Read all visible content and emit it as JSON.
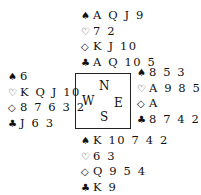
{
  "hands": {
    "north": {
      "spades": "A Q J 9",
      "hearts": "7 2",
      "diamonds": "K J 10",
      "clubs": "A Q 10 5"
    },
    "west": {
      "spades": "6",
      "hearts": "K Q J 10",
      "diamonds": "8 7 6 3 2",
      "clubs": "J 6 3"
    },
    "east": {
      "spades": "8 5 3",
      "hearts": "A 9 8 5 4",
      "diamonds": "A",
      "clubs": "8 7 4 2"
    },
    "south": {
      "spades": "K 10 7 4 2",
      "hearts": "6 3",
      "diamonds": "Q 9 5 4",
      "clubs": "K 9"
    }
  },
  "suit_symbols": {
    "spades": "♠",
    "hearts": "♡",
    "diamonds": "◇",
    "clubs": "♣"
  },
  "compass": {
    "north": "N",
    "west": "W",
    "east": "E",
    "south": "S"
  }
}
